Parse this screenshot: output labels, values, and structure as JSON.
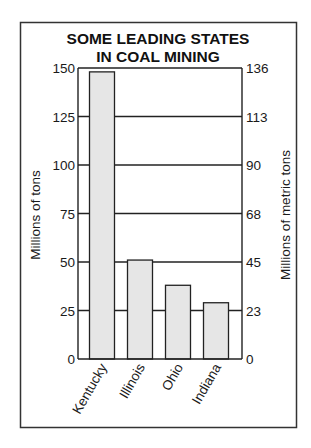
{
  "chart_data": {
    "type": "bar",
    "title": [
      "SOME LEADING STATES",
      "IN COAL MINING"
    ],
    "categories": [
      "Kentucky",
      "Illinois",
      "Ohio",
      "Indiana"
    ],
    "values": [
      148,
      51,
      38,
      29
    ],
    "ylabel": "Millions of tons",
    "ylabel_right": "Millions of metric tons",
    "xlabel": "",
    "ylim": [
      0,
      150
    ],
    "yticks": [
      0,
      25,
      50,
      75,
      100,
      125,
      150
    ],
    "ytick_labels": [
      "0",
      "25",
      "50",
      "75",
      "100",
      "125",
      "150"
    ],
    "ytick_labels_right": [
      "0",
      "23",
      "45",
      "68",
      "90",
      "113",
      "136"
    ],
    "grid": true,
    "legend": "none",
    "colors": {
      "bar_fill": "#e6e6e6",
      "bar_stroke": "#222222",
      "line": "#222222"
    }
  }
}
